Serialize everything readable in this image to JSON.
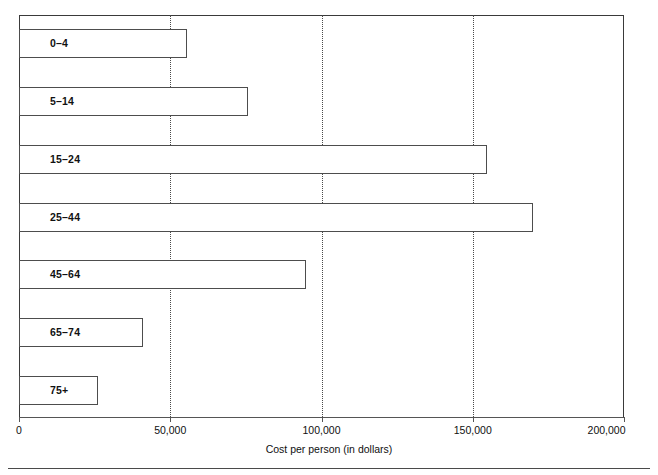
{
  "chart_data": {
    "type": "bar",
    "orientation": "horizontal",
    "title": "",
    "subtitle": "",
    "xlabel": "Cost per person (in dollars)",
    "ylabel": "",
    "xlim": [
      0,
      200000
    ],
    "ylim": null,
    "grid": "vertical dotted gridlines at 50,000 / 100,000 / 150,000",
    "legend": "none",
    "categories": [
      "0–4",
      "5–14",
      "15–24",
      "25–44",
      "45–64",
      "65–74",
      "75+"
    ],
    "values": [
      55400,
      75600,
      154800,
      170000,
      95000,
      41000,
      26000
    ],
    "xticks": [
      0,
      50000,
      100000,
      150000,
      200000
    ],
    "xticklabels": [
      "0",
      "50,000",
      "100,000",
      "150,000",
      "200,000"
    ],
    "bar_style": {
      "fill": "#ffffff",
      "edge": "#4d4d4d",
      "label_position": "inside-left"
    }
  },
  "axis": {
    "title": "Cost per person (in dollars)"
  }
}
